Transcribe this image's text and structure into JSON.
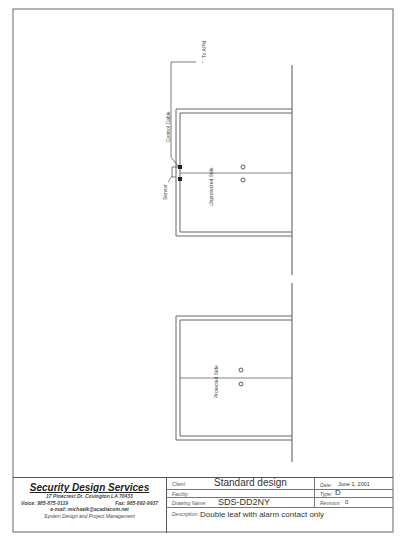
{
  "drawing": {
    "labels": {
      "to_apm": "To APM",
      "control_cable": "Control Cable",
      "sensor": "Sensor",
      "unprotected_side": "Unprotected Side",
      "protected_side": "Protected Side"
    }
  },
  "title_block": {
    "company": {
      "name": "Security Design Services",
      "address": "17 Pinecrest Dr.  Covington LA 70433",
      "voice": "Voice: 985-875-0119",
      "fax": "Fax: 985-892-9937",
      "email": "e-mail: michaelk@acadiacom.net",
      "tagline": "System Design and Project Management"
    },
    "client_label": "Client:",
    "client_value": "Standard design",
    "facility_label": "Facility:",
    "facility_value": "",
    "drawing_name_label": "Drawing Name:",
    "drawing_name_value": "SDS-DD2NY",
    "description_label": "Description:",
    "description_value": "Double leaf with alarm contact only",
    "date_label": "Date:",
    "date_value": "June 1, 2001",
    "type_label": "Type:",
    "type_value": "D",
    "revision_label": "Revision:",
    "revision_value": "0"
  }
}
